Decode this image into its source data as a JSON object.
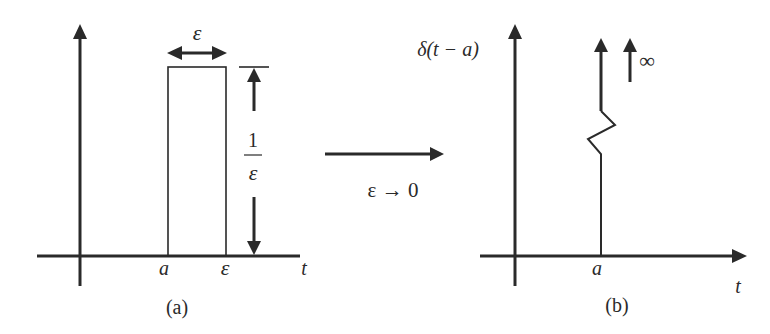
{
  "figure": {
    "panel_a": {
      "caption": "(a)",
      "width_label": "ε",
      "height_label_numerator": "1",
      "height_label_denominator": "ε",
      "x_tick_labels": [
        "a",
        "ε"
      ],
      "x_axis_label": "t",
      "shape": "rectangular pulse of width ε and height 1/ε starting at a"
    },
    "transition": {
      "label": "ε → 0"
    },
    "panel_b": {
      "caption": "(b)",
      "function_label": "δ(t − a)",
      "infinity_label": "∞",
      "x_tick_labels": [
        "a"
      ],
      "x_axis_label": "t",
      "shape": "impulse at t = a with infinite height (broken-line zigzag)"
    },
    "colors": {
      "ink": "#2a2a2a",
      "background": "#ffffff"
    }
  }
}
